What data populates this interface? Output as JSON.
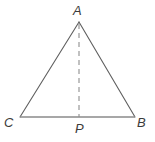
{
  "figure": {
    "kind": "geometry-diagram",
    "background_color": "#ffffff",
    "canvas": {
      "width": 155,
      "height": 142
    },
    "colors": {
      "base_line": "#8a8a8a",
      "slant_line": "#5f5f5f",
      "dashed_line": "#8f8f8f",
      "label_text": "#3b3b3b"
    },
    "points": {
      "A": {
        "label": "A",
        "x": 79,
        "y": 22
      },
      "C": {
        "label": "C",
        "x": 20,
        "y": 117
      },
      "B": {
        "label": "B",
        "x": 135,
        "y": 117
      },
      "P": {
        "label": "P",
        "x": 79,
        "y": 117
      }
    },
    "segments": [
      {
        "name": "side-CA",
        "from": "C",
        "to": "A",
        "style": "solid",
        "color": "#5f5f5f",
        "width": 1.1
      },
      {
        "name": "side-AB",
        "from": "A",
        "to": "B",
        "style": "solid",
        "color": "#5f5f5f",
        "width": 1.1
      },
      {
        "name": "base-CB",
        "from": "C",
        "to": "B",
        "style": "solid",
        "color": "#8a8a8a",
        "width": 1.6
      },
      {
        "name": "altitude-AP",
        "from": "A",
        "to": "P",
        "style": "dashed",
        "color": "#8f8f8f",
        "width": 1.1,
        "dash": "5 4"
      }
    ]
  }
}
